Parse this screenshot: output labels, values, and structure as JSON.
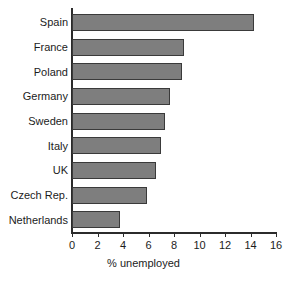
{
  "chart_data": {
    "type": "bar",
    "orientation": "horizontal",
    "title": "",
    "subtitle": "",
    "xlabel": "% unemployed",
    "ylabel": "",
    "categories": [
      "Spain",
      "France",
      "Poland",
      "Germany",
      "Sweden",
      "Italy",
      "UK",
      "Czech Rep.",
      "Netherlands"
    ],
    "values": [
      14.3,
      8.8,
      8.6,
      7.7,
      7.3,
      7.0,
      6.6,
      5.9,
      3.8
    ],
    "xlim": [
      0,
      16
    ],
    "xticks": [
      0,
      2,
      4,
      6,
      8,
      10,
      12,
      14,
      16
    ],
    "xtick_labels": [
      "0",
      "2",
      "4",
      "6",
      "8",
      "10",
      "12",
      "14",
      "16"
    ],
    "grid": false,
    "legend": false,
    "legend_position": "none",
    "bar_color": "#7e7e7e",
    "bar_border_color": "#3a3a3a",
    "axis_color": "#2b2b2b",
    "text_color": "#1c1c1c",
    "background": "#ffffff"
  }
}
